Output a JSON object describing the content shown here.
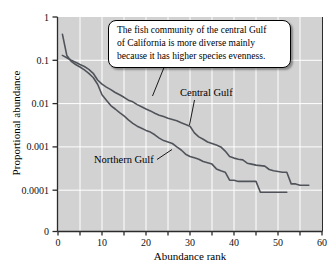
{
  "callout": {
    "lines": [
      "The fish community of the central Gulf",
      "of California is more diverse mainly",
      "because it has higher species evenness."
    ]
  },
  "chart_data": {
    "type": "line",
    "title": "",
    "xlabel": "Abundance rank",
    "ylabel": "Proportional abundance",
    "x_axis": {
      "ticks": [
        0,
        10,
        20,
        30,
        40,
        50,
        60
      ],
      "minor_tick_step": 5,
      "range": [
        0,
        60
      ]
    },
    "y_axis": {
      "scale": "log",
      "tick_labels": [
        "1",
        "0.1",
        "0.01",
        "0.001",
        "0.0001",
        "0"
      ],
      "note": "log decades from 1 down to 0.0001; axis breaks to 0 at the origin"
    },
    "grid": {
      "vertical_every_ranks": 5,
      "horizontal": "one line per decade",
      "color": "#ffffff"
    },
    "colors": {
      "plot_background": "#d2d2d2",
      "line": "#50545a",
      "axis": "#2b2b2b",
      "text": "#111111"
    },
    "series": [
      {
        "name": "Central Gulf",
        "x_start_rank": 1,
        "values": [
          0.13,
          0.115,
          0.1,
          0.09,
          0.08,
          0.072,
          0.062,
          0.05,
          0.035,
          0.028,
          0.024,
          0.021,
          0.018,
          0.016,
          0.014,
          0.012,
          0.011,
          0.0095,
          0.0085,
          0.0075,
          0.0068,
          0.006,
          0.0054,
          0.005,
          0.0046,
          0.0043,
          0.004,
          0.0036,
          0.0033,
          0.003,
          0.0021,
          0.0017,
          0.0015,
          0.0013,
          0.0012,
          0.0011,
          0.001,
          0.0008,
          0.0006,
          0.00055,
          0.00052,
          0.0005,
          0.00042,
          0.0004,
          0.00038,
          0.00037,
          0.00036,
          0.0003,
          0.00028,
          0.00027,
          0.00026,
          0.00026,
          0.00014,
          0.00014,
          0.00013,
          0.00013,
          0.00013
        ]
      },
      {
        "name": "Northern Gulf",
        "x_start_rank": 1,
        "values": [
          0.4,
          0.13,
          0.095,
          0.08,
          0.07,
          0.06,
          0.05,
          0.04,
          0.028,
          0.016,
          0.012,
          0.009,
          0.0075,
          0.0062,
          0.0052,
          0.0042,
          0.0035,
          0.003,
          0.0027,
          0.0024,
          0.0022,
          0.0019,
          0.0016,
          0.0014,
          0.0013,
          0.0012,
          0.001,
          0.00085,
          0.00068,
          0.0006,
          0.00056,
          0.00052,
          0.00046,
          0.00043,
          0.0004,
          0.00031,
          0.00028,
          0.00026,
          0.00017,
          0.00017,
          0.00016,
          0.00016,
          0.00016,
          0.00016,
          0.00016,
          9e-05,
          9e-05,
          9e-05,
          9e-05,
          9e-05,
          9e-05,
          9e-05
        ]
      }
    ]
  }
}
